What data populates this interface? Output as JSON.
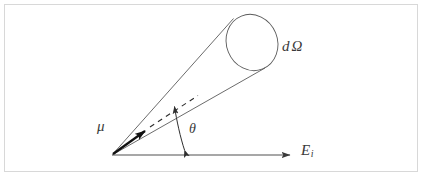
{
  "figure": {
    "domain": "diagram",
    "background_color": "#ffffff",
    "border_color": "#d8d8d8",
    "stroke_color": "#4a4a4a",
    "axis_color": "#6e6e6e",
    "vector_color": "#111111",
    "labels": {
      "mu": "μ",
      "theta": "θ",
      "domega_d": "d",
      "domega_omega": "Ω",
      "incident_energy_base": "E",
      "incident_energy_sub": "i"
    },
    "geometry": {
      "apex": [
        112,
        155
      ],
      "axis_start": [
        112,
        155
      ],
      "axis_end": [
        297,
        155
      ],
      "cone_upper_end": [
        233,
        18
      ],
      "cone_lower_end": [
        264,
        68
      ],
      "cone_axis_end": [
        250,
        44
      ],
      "ellipse_center": [
        252,
        42
      ],
      "ellipse_rx": 26,
      "ellipse_ry": 29,
      "ellipse_rotation_deg": -22,
      "mu_arrow_end": [
        151,
        127
      ],
      "dashed_end": [
        197,
        96
      ],
      "arc_foot": [
        185,
        155
      ],
      "arc_head": [
        173,
        102
      ]
    }
  }
}
